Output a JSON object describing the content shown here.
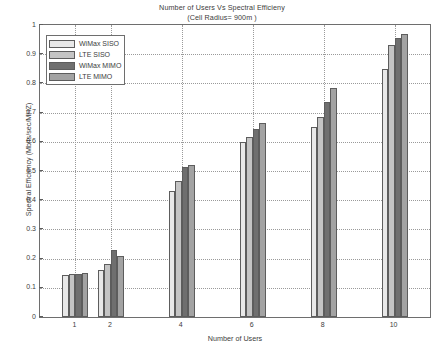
{
  "chart_data": {
    "type": "bar",
    "title": "Number of Users Vs Spectral Efficieny",
    "subtitle": "(Cell Radius= 900m )",
    "xlabel": "Number of Users",
    "ylabel": "Spectral Efficiency (Mbits/sec/MHZ)",
    "xlim": [
      0,
      11
    ],
    "ylim": [
      0,
      1
    ],
    "grid": true,
    "legend_position": "top-left-inside",
    "categories": [
      1,
      2,
      4,
      6,
      8,
      10
    ],
    "xticks": [
      "1",
      "2",
      "4",
      "6",
      "8",
      "10"
    ],
    "yticks": [
      "0",
      "0.1",
      "0.2",
      "0.3",
      "0.4",
      "0.5",
      "0.6",
      "0.7",
      "0.8",
      "0.9",
      "1"
    ],
    "series": [
      {
        "name": "WiMax  SISO",
        "color": "#e8e8e8",
        "values": [
          0.145,
          0.16,
          0.43,
          0.6,
          0.65,
          0.85
        ]
      },
      {
        "name": "LTE SISO",
        "color": "#c4c4c4",
        "values": [
          0.148,
          0.182,
          0.465,
          0.615,
          0.685,
          0.93
        ]
      },
      {
        "name": "WiMax  MIMO",
        "color": "#6f6f6f",
        "values": [
          0.148,
          0.228,
          0.515,
          0.645,
          0.735,
          0.955
        ]
      },
      {
        "name": "LTE MIMO",
        "color": "#a3a3a3",
        "values": [
          0.152,
          0.21,
          0.52,
          0.665,
          0.785,
          0.97
        ]
      }
    ]
  },
  "legend": {
    "items": [
      {
        "label": "WiMax  SISO"
      },
      {
        "label": "LTE SISO"
      },
      {
        "label": "WiMax  MIMO"
      },
      {
        "label": "LTE MIMO"
      }
    ]
  },
  "axes": {
    "x_axis_label": "Number of Users",
    "y_axis_label": "Spectral Efficiency (Mbits/sec/MHZ)"
  },
  "colors": {
    "axis": "#6e6e6e",
    "grid": "#9a9a9a",
    "text": "#3c3c3c",
    "background": "#ffffff"
  }
}
